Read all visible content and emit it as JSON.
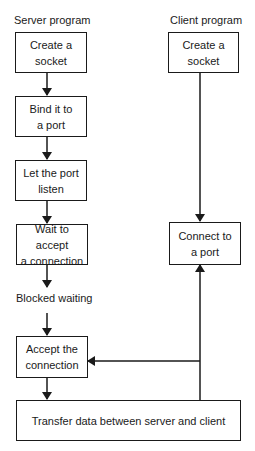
{
  "diagram": {
    "server_label": "Server program",
    "client_label": "Client program",
    "blocked_label": "Blocked waiting",
    "server_steps": [
      {
        "line1": "Create a",
        "line2": "socket"
      },
      {
        "line1": "Bind it to",
        "line2": "a port"
      },
      {
        "line1": "Let the port",
        "line2": "listen"
      },
      {
        "line1": "Wait to accept",
        "line2": "a connection"
      },
      {
        "line1": "Accept the",
        "line2": "connection"
      }
    ],
    "client_steps": [
      {
        "line1": "Create a",
        "line2": "socket"
      },
      {
        "line1": "Connect to",
        "line2": "a port"
      }
    ],
    "transfer": "Transfer data between server and client",
    "line_color": "#1a1a1a"
  }
}
